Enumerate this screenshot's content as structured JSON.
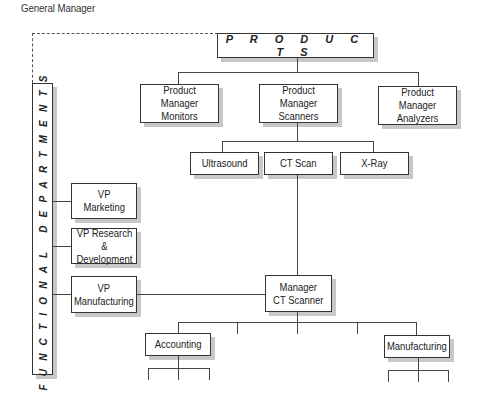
{
  "diagram": {
    "type": "org-chart",
    "general_manager_label": "General Manager",
    "products_title": "P R O D U C T S",
    "functional_departments_title": "FUNCTIONAL DEPARTMENTS",
    "product_managers": [
      {
        "label": "Product Manager\nMonitors"
      },
      {
        "label": "Product Manager\nScanners"
      },
      {
        "label": "Product Manager\nAnalyzers"
      }
    ],
    "scanner_lines": [
      {
        "label": "Ultrasound"
      },
      {
        "label": "CT Scan"
      },
      {
        "label": "X-Ray"
      }
    ],
    "vps": [
      {
        "label": "VP\nMarketing"
      },
      {
        "label": "VP Research &\nDevelopment"
      },
      {
        "label": "VP\nManufacturing"
      }
    ],
    "manager": {
      "label": "Manager\nCT Scanner"
    },
    "manager_units": [
      {
        "label": "Accounting"
      },
      {
        "label": "Manufacturing"
      }
    ],
    "colors": {
      "line": "#444444",
      "border": "#333333",
      "shadow": "#c8c8c8",
      "background": "#ffffff"
    }
  }
}
